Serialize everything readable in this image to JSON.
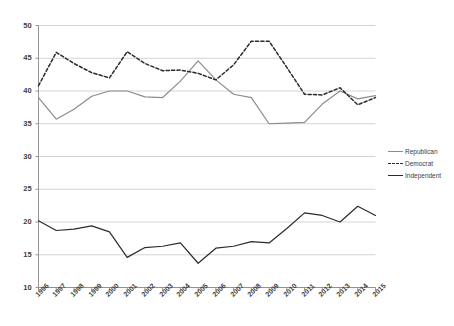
{
  "chart_data": {
    "type": "line",
    "title": "",
    "subtitle": "",
    "xlabel": "",
    "ylabel": "",
    "x": [
      1996,
      1997,
      1998,
      1999,
      2000,
      2001,
      2002,
      2003,
      2004,
      2005,
      2006,
      2007,
      2008,
      2009,
      2010,
      2011,
      2012,
      2013,
      2014,
      2015
    ],
    "categories": [
      "1996",
      "1997",
      "1998",
      "1999",
      "2000",
      "2001",
      "2002",
      "2003",
      "2004",
      "2005",
      "2006",
      "2007",
      "2008",
      "2009",
      "2010",
      "2011",
      "2012",
      "2013",
      "2014",
      "2015"
    ],
    "xlim": [
      1996,
      2015
    ],
    "ylim": [
      10,
      50
    ],
    "yticks": [
      10,
      15,
      20,
      25,
      30,
      35,
      40,
      45,
      50
    ],
    "ytick_labels": [
      "10",
      "15",
      "20",
      "25",
      "30",
      "35",
      "40",
      "45",
      "50"
    ],
    "grid": true,
    "grid_axis": "y",
    "legend_position": "right",
    "series": [
      {
        "name": "Republican",
        "color": "#8c8c8c",
        "style": "solid",
        "values": [
          39.0,
          35.7,
          37.2,
          39.2,
          40.0,
          40.0,
          39.1,
          39.0,
          41.5,
          44.6,
          41.7,
          39.5,
          39.0,
          35.0,
          35.1,
          35.2,
          38.0,
          40.0,
          38.8,
          39.3
        ]
      },
      {
        "name": "Democrat",
        "color": "#2b2b2b",
        "style": "dashed",
        "values": [
          40.8,
          45.9,
          44.2,
          42.8,
          42.0,
          46.0,
          44.2,
          43.1,
          43.2,
          42.7,
          41.7,
          44.0,
          47.6,
          47.6,
          43.6,
          39.5,
          39.4,
          40.5,
          37.9,
          39.0
        ]
      },
      {
        "name": "Independent",
        "color": "#2b2b2b",
        "style": "solid",
        "values": [
          20.2,
          18.7,
          18.9,
          19.4,
          18.5,
          14.6,
          16.1,
          16.3,
          16.8,
          13.7,
          16.0,
          16.3,
          17.0,
          16.8,
          19.0,
          21.4,
          21.0,
          20.0,
          22.4,
          21.0
        ]
      }
    ]
  },
  "legend": {
    "items": [
      {
        "label": "Republican"
      },
      {
        "label": "Democrat"
      },
      {
        "label": "Independent"
      }
    ]
  }
}
